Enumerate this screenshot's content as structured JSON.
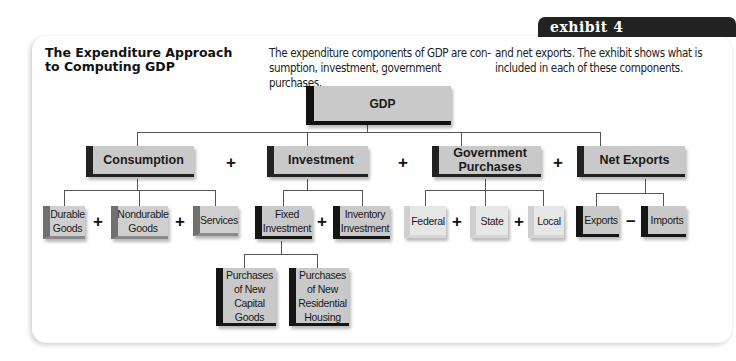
{
  "exhibit": {
    "label": "exhibit 4"
  },
  "title": "The Expenditure Approach to Computing GDP",
  "description": {
    "col1": "The expenditure components of GDP are con-sumption, investment, government purchases,",
    "col2": "and net exports. The exhibit shows what is included in each of these components."
  },
  "diagram": {
    "root": {
      "label": "GDP"
    },
    "components": [
      {
        "label": "Consumption",
        "children": [
          "Durable Goods",
          "Nondurable Goods",
          "Services"
        ],
        "child_operators": [
          "+",
          "+"
        ]
      },
      {
        "label": "Investment",
        "children": [
          "Fixed Investment",
          "Inventory Investment"
        ],
        "child_operators": [
          "+"
        ],
        "fixed_investment_children": [
          "Purchases of New Capital Goods",
          "Purchases of New Residential Housing"
        ]
      },
      {
        "label": "Government Purchases",
        "children": [
          "Federal",
          "State",
          "Local"
        ],
        "child_operators": [
          "+",
          "+"
        ]
      },
      {
        "label": "Net Exports",
        "children": [
          "Exports",
          "Imports"
        ],
        "child_operators": [
          "–"
        ]
      }
    ],
    "component_operators": [
      "+",
      "+",
      "+"
    ],
    "colors": {
      "box_fill": "#c9c9c9",
      "dark_bar": "#151515",
      "mid_bar": "#707070",
      "light_bar": "#cfcfcf",
      "tab": "#222222"
    }
  }
}
